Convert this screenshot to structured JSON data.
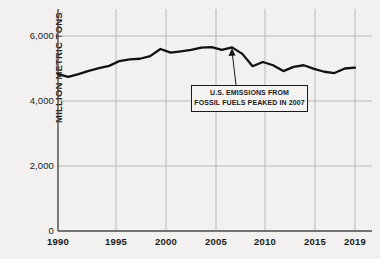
{
  "chart_data": {
    "type": "line",
    "title": "",
    "xlabel": "",
    "ylabel": "MILLION METRIC TONS",
    "xlim": [
      1990,
      2019
    ],
    "ylim": [
      0,
      6800
    ],
    "grid": true,
    "legend": false,
    "y_ticks": [
      {
        "value": 0,
        "label": "0"
      },
      {
        "value": 2000,
        "label": "2,000"
      },
      {
        "value": 4000,
        "label": "4,000"
      },
      {
        "value": 6000,
        "label": "6,000"
      }
    ],
    "x_ticks": [
      {
        "value": 1990,
        "label": "1990"
      },
      {
        "value": 1995,
        "label": "1995"
      },
      {
        "value": 2000,
        "label": "2000"
      },
      {
        "value": 2005,
        "label": "2005"
      },
      {
        "value": 2010,
        "label": "2010"
      },
      {
        "value": 2015,
        "label": "2015"
      },
      {
        "value": 2019,
        "label": "2019"
      }
    ],
    "x": [
      1990,
      1991,
      1992,
      1993,
      1994,
      1995,
      1996,
      1997,
      1998,
      1999,
      2000,
      2001,
      2002,
      2003,
      2004,
      2005,
      2006,
      2007,
      2008,
      2009,
      2010,
      2011,
      2012,
      2013,
      2014,
      2015,
      2016,
      2017,
      2018,
      2019
    ],
    "series": [
      {
        "name": "U.S. CO2 emissions from fossil fuels",
        "values": [
          4830,
          4740,
          4830,
          4930,
          5010,
          5080,
          5230,
          5280,
          5300,
          5380,
          5600,
          5490,
          5530,
          5570,
          5640,
          5660,
          5570,
          5650,
          5450,
          5070,
          5200,
          5100,
          4920,
          5050,
          5100,
          4990,
          4900,
          4860,
          5000,
          5030
        ]
      }
    ],
    "annotations": [
      {
        "name": "peak-callout",
        "lines": [
          "U.S. EMISSIONS FROM",
          "FOSSIL FUELS PEAKED IN 2007"
        ],
        "points_to_year": 2007,
        "points_to_value": 5650
      }
    ],
    "colors": {
      "line": "#111111",
      "grid": "#b8b8b8",
      "axis": "#555555",
      "background": "#f2f1ef",
      "text": "#1a1a1a"
    }
  }
}
